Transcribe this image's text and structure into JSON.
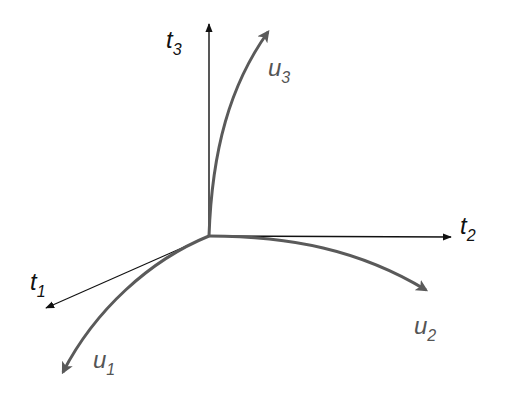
{
  "diagram": {
    "title": "",
    "colors": {
      "axis": "#111111",
      "curve": "#5a5a5a",
      "curve_label": "#555555",
      "background": "#ffffff"
    },
    "origin": [
      209,
      236
    ],
    "axes": [
      {
        "id": "t1",
        "base": "t",
        "sub": "1",
        "end": [
          42,
          310
        ]
      },
      {
        "id": "t2",
        "base": "t",
        "sub": "2",
        "end": [
          455,
          237
        ]
      },
      {
        "id": "t3",
        "base": "t",
        "sub": "3",
        "end": [
          209,
          20
        ]
      }
    ],
    "curves": [
      {
        "id": "u1",
        "base": "u",
        "sub": "1",
        "end": [
          60,
          378
        ]
      },
      {
        "id": "u2",
        "base": "u",
        "sub": "2",
        "end": [
          430,
          293
        ]
      },
      {
        "id": "u3",
        "base": "u",
        "sub": "3",
        "end": [
          272,
          25
        ]
      }
    ],
    "labels": {
      "t1": {
        "base": "t",
        "sub": "1"
      },
      "t2": {
        "base": "t",
        "sub": "2"
      },
      "t3": {
        "base": "t",
        "sub": "3"
      },
      "u1": {
        "base": "u",
        "sub": "1"
      },
      "u2": {
        "base": "u",
        "sub": "2"
      },
      "u3": {
        "base": "u",
        "sub": "3"
      }
    }
  }
}
